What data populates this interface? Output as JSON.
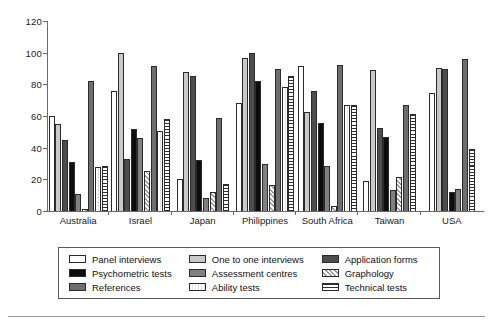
{
  "chart_data": {
    "type": "bar",
    "title": "",
    "xlabel": "",
    "ylabel": "",
    "ylim": [
      0,
      120
    ],
    "yticks": [
      0,
      20,
      40,
      60,
      80,
      100,
      120
    ],
    "grid": false,
    "legend_position": "bottom",
    "categories": [
      "Australia",
      "Israel",
      "Japan",
      "Philippines",
      "South Africa",
      "Taiwan",
      "USA"
    ],
    "series": [
      {
        "name": "Panel interviews",
        "swatch": "white",
        "values": [
          60,
          75.5,
          20.5,
          68.5,
          91.5,
          19,
          74.5
        ]
      },
      {
        "name": "One to one interviews",
        "swatch": "light-gray",
        "values": [
          55,
          100,
          87.5,
          96.5,
          62.5,
          89,
          90.5
        ]
      },
      {
        "name": "Application forms",
        "swatch": "dark-gray",
        "values": [
          45,
          33,
          85.5,
          99.5,
          76,
          52.5,
          90
        ]
      },
      {
        "name": "Psychometric tests",
        "swatch": "black",
        "values": [
          31,
          52,
          32.5,
          82,
          55.5,
          47,
          12
        ]
      },
      {
        "name": "Assessment centres",
        "swatch": "medium-gray",
        "values": [
          11,
          46,
          8.5,
          29.5,
          28.5,
          13,
          14
        ]
      },
      {
        "name": "Graphology",
        "swatch": "diagonal-hatch",
        "values": [
          1,
          25.5,
          12,
          16.5,
          3,
          21.5,
          0
        ]
      },
      {
        "name": "References",
        "swatch": "medium-dark-gray",
        "values": [
          82,
          91.5,
          58.5,
          89.5,
          92,
          67,
          96
        ]
      },
      {
        "name": "Ability tests",
        "swatch": "very-light-gray",
        "values": [
          27.5,
          50.5,
          0,
          78.5,
          67,
          0,
          0
        ]
      },
      {
        "name": "Technical tests",
        "swatch": "horizontal-lines",
        "values": [
          28.5,
          58,
          17,
          85,
          67,
          61,
          39
        ]
      }
    ]
  },
  "legend": {
    "items": [
      {
        "label": "Panel interviews",
        "fill": "f-panel"
      },
      {
        "label": "One to one interviews",
        "fill": "f-oneone"
      },
      {
        "label": "Application forms",
        "fill": "f-appform"
      },
      {
        "label": "Psychometric tests",
        "fill": "f-psycho"
      },
      {
        "label": "Assessment centres",
        "fill": "f-assess"
      },
      {
        "label": "Graphology",
        "fill": "f-graph"
      },
      {
        "label": "References",
        "fill": "f-refs"
      },
      {
        "label": "Ability tests",
        "fill": "f-ability"
      },
      {
        "label": "Technical tests",
        "fill": "f-tech"
      }
    ],
    "order": [
      0,
      1,
      2,
      3,
      4,
      5,
      6,
      7,
      8
    ]
  },
  "style": {
    "series_fill_class": [
      "f-panel",
      "f-oneone",
      "f-appform",
      "f-psycho",
      "f-assess",
      "f-graph",
      "f-refs",
      "f-ability",
      "f-tech"
    ]
  }
}
